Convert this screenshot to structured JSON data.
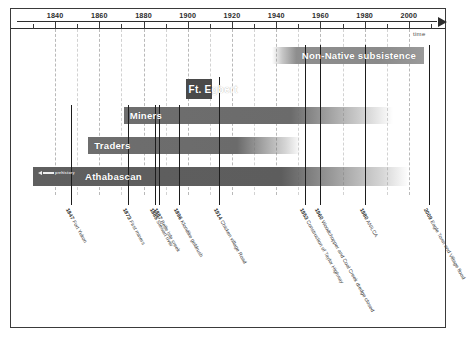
{
  "diagram": {
    "title_axis": "time",
    "axis": {
      "labels": [
        "1840",
        "1860",
        "1880",
        "1900",
        "1920",
        "1940",
        "1960",
        "1980",
        "2000"
      ],
      "start_year": 1830,
      "end_year": 2010,
      "tick_step": 20,
      "minor_step": 10,
      "time_word": "time"
    },
    "bars": [
      {
        "id": "nonnative",
        "label": "Non-Native subsistence",
        "start_year": 1938,
        "end_year": 2007,
        "fade_in": true,
        "fade_out": false
      },
      {
        "id": "egbert",
        "label": "Ft. Egbert",
        "start_year": 1899,
        "end_year": 1911,
        "fade_in": false,
        "fade_out": false
      },
      {
        "id": "miners",
        "label": "Miners",
        "start_year": 1871,
        "end_year": 1993,
        "fade_in": false,
        "fade_out": true
      },
      {
        "id": "traders",
        "label": "Traders",
        "start_year": 1855,
        "end_year": 1951,
        "fade_in": false,
        "fade_out": true
      },
      {
        "id": "athabascan",
        "label": "Athabascan",
        "start_year": 1830,
        "end_year": 2000,
        "fade_in": false,
        "fade_out": true
      }
    ],
    "prehistory_note": "prehistory",
    "events": [
      {
        "year": 1847,
        "year_text": "1847",
        "text": "Fort Yukon"
      },
      {
        "year": 1873,
        "year_text": "1873",
        "text": "First miners"
      },
      {
        "year": 1885,
        "year_text": "1885",
        "text": "Stewart river"
      },
      {
        "year": 1887,
        "year_text": "1887",
        "text": "Belle Isle creek"
      },
      {
        "year": 1896,
        "year_text": "1896",
        "text": "Klondike goldrush"
      },
      {
        "year": 1914,
        "year_text": "1914",
        "text": "Chicken village Road"
      },
      {
        "year": 1953,
        "year_text": "1953",
        "text": "Construction of Taylor Highway"
      },
      {
        "year": 1960,
        "year_text": "1960",
        "text": "Woodchopper and Coal Creek dredge closed"
      },
      {
        "year": 1980,
        "year_text": "1980",
        "text": "ANILCA"
      },
      {
        "year": 2009,
        "year_text": "2009",
        "text": "Eagle Town and Village flood"
      }
    ],
    "colors": {
      "frame": "#3a3a3a",
      "axis": "#2e2e2e",
      "bar_dark": "#5d5d5d",
      "bar_mid": "#6b6b6b",
      "bar_light": "#8e8e8e",
      "event_line": "#1d1d1d",
      "grid": "#b9b9b9",
      "label_text": "#3d3d3d",
      "bar_label_text": "#ffffff"
    }
  }
}
